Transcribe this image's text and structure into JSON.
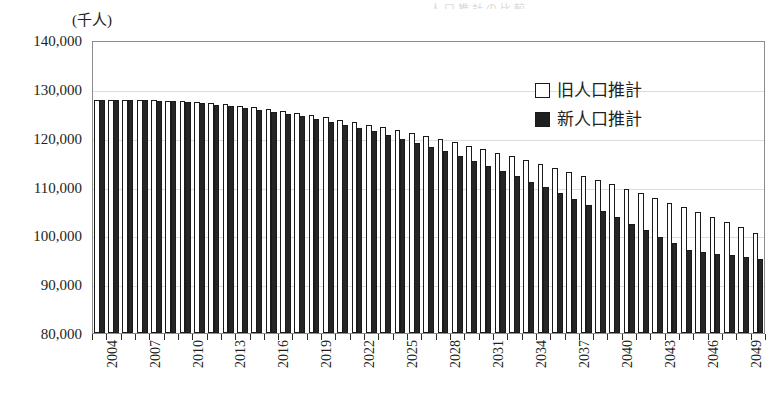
{
  "unit_label": "(千人)",
  "title_faint": "人口推計の比較",
  "legend": {
    "position": "top-right",
    "items": [
      {
        "label": "旧人口推計",
        "swatch": "hollow-square-icon",
        "color": "#ffffff"
      },
      {
        "label": "新人口推計",
        "swatch": "filled-square-icon",
        "color": "#262626"
      }
    ]
  },
  "chart_data": {
    "type": "bar",
    "title": "",
    "subtitle": "",
    "xlabel": "",
    "ylabel": "(千人)",
    "ylim": [
      80000,
      140000
    ],
    "ytick_labels": [
      "140,000",
      "130,000",
      "120,000",
      "110,000",
      "100,000",
      "90,000",
      "80,000"
    ],
    "ytick_values": [
      140000,
      130000,
      120000,
      110000,
      100000,
      90000,
      80000
    ],
    "grid": true,
    "legend_position": "top-right",
    "xtick_step_years": 3,
    "xtick_labels": [
      "2004",
      "2007",
      "2010",
      "2013",
      "2016",
      "2019",
      "2022",
      "2025",
      "2028",
      "2031",
      "2034",
      "2037",
      "2040",
      "2043",
      "2046",
      "2049"
    ],
    "categories": [
      "2004",
      "2005",
      "2006",
      "2007",
      "2008",
      "2009",
      "2010",
      "2011",
      "2012",
      "2013",
      "2014",
      "2015",
      "2016",
      "2017",
      "2018",
      "2019",
      "2020",
      "2021",
      "2022",
      "2023",
      "2024",
      "2025",
      "2026",
      "2027",
      "2028",
      "2029",
      "2030",
      "2031",
      "2032",
      "2033",
      "2034",
      "2035",
      "2036",
      "2037",
      "2038",
      "2039",
      "2040",
      "2041",
      "2042",
      "2043",
      "2044",
      "2045",
      "2046",
      "2047",
      "2048",
      "2049",
      "2050"
    ],
    "series": [
      {
        "name": "旧人口推計",
        "color": "#ffffff",
        "edgecolor": "#1a1a1a",
        "values": [
          127700,
          127760,
          127780,
          127760,
          127700,
          127610,
          127470,
          127290,
          127070,
          126820,
          126530,
          126210,
          125860,
          125480,
          125070,
          124640,
          124190,
          123710,
          123200,
          122670,
          122120,
          121540,
          120940,
          120320,
          119680,
          119020,
          118340,
          117640,
          116920,
          116180,
          115420,
          114640,
          113840,
          113020,
          112180,
          111320,
          110440,
          109540,
          108620,
          107680,
          106720,
          105740,
          104740,
          103720,
          102680,
          101620,
          100540
        ]
      },
      {
        "name": "新人口推計",
        "color": "#262626",
        "edgecolor": "#1a1a1a",
        "values": [
          127690,
          127710,
          127700,
          127650,
          127560,
          127430,
          127260,
          127040,
          126780,
          126480,
          126140,
          125760,
          125340,
          124880,
          124380,
          123840,
          123260,
          122640,
          121980,
          121280,
          120540,
          119760,
          118940,
          118080,
          117180,
          116240,
          115260,
          114240,
          113190,
          112110,
          111000,
          109860,
          108690,
          107490,
          106260,
          105000,
          103720,
          102420,
          101100,
          99760,
          98400,
          97020,
          96620,
          96240,
          95880,
          95540,
          95150
        ]
      }
    ]
  }
}
